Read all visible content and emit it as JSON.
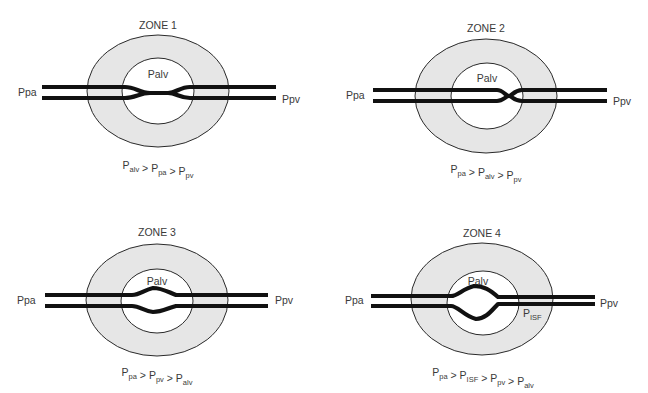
{
  "figure": {
    "zones": [
      {
        "id": "zone1",
        "title": "ZONE 1",
        "alveolar_label": "Palv",
        "left_label": "Ppa",
        "right_label": "Ppv",
        "vessel_state": "collapsed",
        "equation": [
          {
            "base": "P",
            "sub": "alv"
          },
          {
            "op": ">"
          },
          {
            "base": "P",
            "sub": "pa"
          },
          {
            "op": ">"
          },
          {
            "base": "P",
            "sub": "pv"
          }
        ]
      },
      {
        "id": "zone2",
        "title": "ZONE 2",
        "alveolar_label": "Palv",
        "left_label": "Ppa",
        "right_label": "Ppv",
        "vessel_state": "partially-collapsed-downstream",
        "equation": [
          {
            "base": "P",
            "sub": "pa"
          },
          {
            "op": ">"
          },
          {
            "base": "P",
            "sub": "alv"
          },
          {
            "op": ">"
          },
          {
            "base": "P",
            "sub": "pv"
          }
        ]
      },
      {
        "id": "zone3",
        "title": "ZONE 3",
        "alveolar_label": "Palv",
        "left_label": "Ppa",
        "right_label": "Ppv",
        "vessel_state": "open",
        "equation": [
          {
            "base": "P",
            "sub": "pa"
          },
          {
            "op": ">"
          },
          {
            "base": "P",
            "sub": "pv"
          },
          {
            "op": ">"
          },
          {
            "base": "P",
            "sub": "alv"
          }
        ]
      },
      {
        "id": "zone4",
        "title": "ZONE 4",
        "alveolar_label": "Palv",
        "interstitial_label": {
          "base": "P",
          "sub": "ISF"
        },
        "left_label": "Ppa",
        "right_label": "Ppv",
        "vessel_state": "distended",
        "equation": [
          {
            "base": "P",
            "sub": "pa"
          },
          {
            "op": ">"
          },
          {
            "base": "P",
            "sub": "ISF"
          },
          {
            "op": ">"
          },
          {
            "base": "P",
            "sub": "pv"
          },
          {
            "op": ">"
          },
          {
            "base": "P",
            "sub": "alv"
          }
        ]
      }
    ]
  }
}
